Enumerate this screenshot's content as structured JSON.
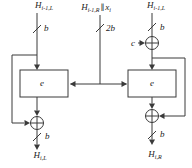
{
  "diagram": {
    "inputs": {
      "left": {
        "base": "H",
        "sub": "i-1,L"
      },
      "middle": {
        "h": "H",
        "h_sub": "i-1,R",
        "concat": "∥",
        "x": "x",
        "x_sub": "i"
      },
      "right": {
        "base": "H",
        "sub": "i-1,L"
      }
    },
    "constant_label": "c",
    "cipher": {
      "left_label": "e",
      "right_label": "e"
    },
    "bus_widths": {
      "left_top": "b",
      "middle": "2b",
      "right_top": "b",
      "left_bottom": "b",
      "right_bottom": "b"
    },
    "outputs": {
      "left": {
        "base": "H",
        "sub": "i,L"
      },
      "right": {
        "base": "H",
        "sub": "i,R"
      }
    }
  },
  "colors": {
    "line": "#3a3a3a",
    "text": "#222222",
    "background": "#ffffff"
  }
}
